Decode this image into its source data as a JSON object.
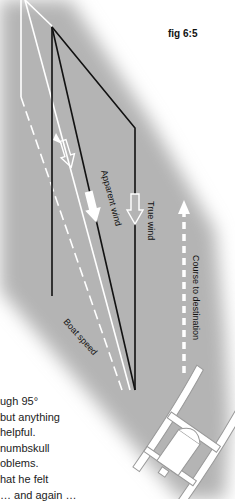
{
  "figure": {
    "label": "fig 6:5",
    "labels": {
      "apparent_wind": "Apparent wind",
      "true_wind": "True wind",
      "boat_speed": "Boat speed",
      "course": "Course to destination"
    },
    "colors": {
      "background": "#ffffff",
      "shaded_region": "#b4b4b4",
      "lines": "#111111",
      "arrows": "#ffffff"
    }
  },
  "text_lines": [
    "ugh 95°",
    "but anything",
    "helpful.",
    " numbskull",
    "oblems.",
    "hat he felt",
    "… and again …"
  ]
}
